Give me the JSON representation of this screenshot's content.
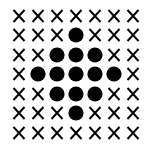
{
  "grid": {
    "rows": 7,
    "cols": 7,
    "colors": {
      "mark": "#000000",
      "background": "#ffffff"
    },
    "cells": [
      [
        "X",
        "X",
        "X",
        "X",
        "X",
        "X",
        "X"
      ],
      [
        "X",
        "X",
        "X",
        "O",
        "X",
        "X",
        "X"
      ],
      [
        "X",
        "X",
        "O",
        "O",
        "O",
        "X",
        "X"
      ],
      [
        "X",
        "O",
        "O",
        "O",
        "O",
        "O",
        "X"
      ],
      [
        "X",
        "X",
        "O",
        "O",
        "O",
        "X",
        "X"
      ],
      [
        "X",
        "X",
        "X",
        "O",
        "X",
        "X",
        "X"
      ],
      [
        "X",
        "X",
        "X",
        "X",
        "X",
        "X",
        "X"
      ]
    ],
    "legend": {
      "X": "cross-icon",
      "O": "dot-icon"
    }
  }
}
